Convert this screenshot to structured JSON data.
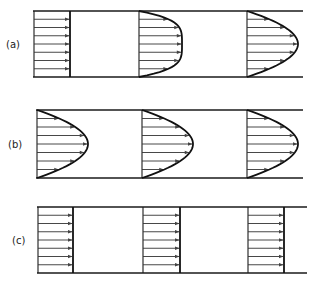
{
  "figure": {
    "panels": [
      {
        "label": "(a)",
        "label_x": 6,
        "label_y": 48,
        "top_y": 11,
        "bottom_y": 77,
        "wall_x0": 33,
        "wall_x1": 303,
        "profiles": [
          {
            "base_x": 34,
            "type": "flat",
            "depth": 36
          },
          {
            "base_x": 139,
            "type": "blunt",
            "depth": 43
          },
          {
            "base_x": 247,
            "type": "parabolic",
            "depth": 51
          }
        ]
      },
      {
        "label": "(b)",
        "label_x": 8,
        "label_y": 148,
        "top_y": 110,
        "bottom_y": 178,
        "wall_x0": 36,
        "wall_x1": 303,
        "profiles": [
          {
            "base_x": 37,
            "type": "parabolic",
            "depth": 51
          },
          {
            "base_x": 142,
            "type": "parabolic",
            "depth": 51
          },
          {
            "base_x": 247,
            "type": "parabolic",
            "depth": 51
          }
        ]
      },
      {
        "label": "(c)",
        "label_x": 12,
        "label_y": 244,
        "top_y": 207,
        "bottom_y": 273,
        "wall_x0": 37,
        "wall_x1": 307,
        "profiles": [
          {
            "base_x": 38,
            "type": "flat",
            "depth": 35
          },
          {
            "base_x": 143,
            "type": "flat",
            "depth": 37
          },
          {
            "base_x": 248,
            "type": "flat",
            "depth": 36
          }
        ]
      }
    ],
    "arrows_per_profile": 7,
    "colors": {
      "line": "#1a1a1a",
      "arrow": "#333333",
      "background": "#ffffff"
    }
  }
}
